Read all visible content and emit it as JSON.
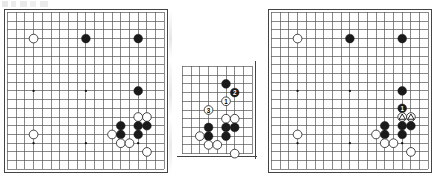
{
  "figure": {
    "background_color": "#ffffff",
    "line_color": "#555555",
    "border_color": "#444444",
    "black_stone_color": "#1a1a1a",
    "white_stone_color": "#ffffff",
    "white_stone_border": "#333333",
    "marker_label_black_color": "#ffffff",
    "marker_label_white_color": "#000000"
  },
  "boards": [
    {
      "id": "board-left",
      "name": "diagram-1",
      "kind": "full-board",
      "size": 19,
      "x": 7,
      "y": 12,
      "cell": 8.72,
      "star_points": [
        [
          4,
          4
        ],
        [
          10,
          4
        ],
        [
          16,
          4
        ],
        [
          4,
          10
        ],
        [
          10,
          10
        ],
        [
          16,
          10
        ],
        [
          4,
          16
        ],
        [
          10,
          16
        ],
        [
          16,
          16
        ]
      ],
      "stones": [
        {
          "col": 4,
          "row": 4,
          "color": "white"
        },
        {
          "col": 10,
          "row": 4,
          "color": "black"
        },
        {
          "col": 16,
          "row": 4,
          "color": "black"
        },
        {
          "col": 16,
          "row": 10,
          "color": "black"
        },
        {
          "col": 16,
          "row": 13,
          "color": "white"
        },
        {
          "col": 17,
          "row": 13,
          "color": "white"
        },
        {
          "col": 14,
          "row": 14,
          "color": "black"
        },
        {
          "col": 16,
          "row": 14,
          "color": "black"
        },
        {
          "col": 17,
          "row": 14,
          "color": "black"
        },
        {
          "col": 13,
          "row": 15,
          "color": "white"
        },
        {
          "col": 14,
          "row": 15,
          "color": "black"
        },
        {
          "col": 16,
          "row": 15,
          "color": "black"
        },
        {
          "col": 4,
          "row": 15,
          "color": "white"
        },
        {
          "col": 14,
          "row": 16,
          "color": "white"
        },
        {
          "col": 15,
          "row": 16,
          "color": "white"
        },
        {
          "col": 17,
          "row": 17,
          "color": "white"
        }
      ],
      "markers": []
    },
    {
      "id": "board-middle",
      "name": "diagram-2",
      "kind": "corner-section",
      "cols": 9,
      "rows": 11,
      "x": 182,
      "y": 66,
      "cell": 8.72,
      "edges": {
        "right": true,
        "bottom": true
      },
      "star_points": [],
      "stones": [
        {
          "col": 6,
          "row": 3,
          "color": "black"
        },
        {
          "col": 7,
          "row": 4,
          "color": "black"
        },
        {
          "col": 6,
          "row": 5,
          "color": "white"
        },
        {
          "col": 4,
          "row": 6,
          "color": "white"
        },
        {
          "col": 6,
          "row": 7,
          "color": "white"
        },
        {
          "col": 7,
          "row": 7,
          "color": "white"
        },
        {
          "col": 4,
          "row": 8,
          "color": "black"
        },
        {
          "col": 6,
          "row": 8,
          "color": "black"
        },
        {
          "col": 7,
          "row": 8,
          "color": "black"
        },
        {
          "col": 3,
          "row": 9,
          "color": "white"
        },
        {
          "col": 4,
          "row": 9,
          "color": "black"
        },
        {
          "col": 6,
          "row": 9,
          "color": "black"
        },
        {
          "col": 4,
          "row": 10,
          "color": "white"
        },
        {
          "col": 5,
          "row": 10,
          "color": "white"
        },
        {
          "col": 7,
          "row": 11,
          "color": "white"
        }
      ],
      "markers": [
        {
          "col": 6,
          "row": 5,
          "label": "1",
          "stone": "white"
        },
        {
          "col": 7,
          "row": 4,
          "label": "2",
          "stone": "black"
        },
        {
          "col": 4,
          "row": 6,
          "label": "3",
          "stone": "white"
        }
      ]
    },
    {
      "id": "board-right",
      "name": "diagram-3",
      "kind": "full-board",
      "size": 19,
      "x": 271,
      "y": 12,
      "cell": 8.72,
      "star_points": [
        [
          4,
          4
        ],
        [
          10,
          4
        ],
        [
          16,
          4
        ],
        [
          4,
          10
        ],
        [
          10,
          10
        ],
        [
          16,
          10
        ],
        [
          4,
          16
        ],
        [
          10,
          16
        ],
        [
          16,
          16
        ]
      ],
      "stones": [
        {
          "col": 4,
          "row": 4,
          "color": "white"
        },
        {
          "col": 10,
          "row": 4,
          "color": "black"
        },
        {
          "col": 16,
          "row": 4,
          "color": "black"
        },
        {
          "col": 16,
          "row": 10,
          "color": "black"
        },
        {
          "col": 16,
          "row": 12,
          "color": "black"
        },
        {
          "col": 16,
          "row": 13,
          "color": "white"
        },
        {
          "col": 17,
          "row": 13,
          "color": "white"
        },
        {
          "col": 14,
          "row": 14,
          "color": "black"
        },
        {
          "col": 16,
          "row": 14,
          "color": "black"
        },
        {
          "col": 17,
          "row": 14,
          "color": "black"
        },
        {
          "col": 13,
          "row": 15,
          "color": "white"
        },
        {
          "col": 14,
          "row": 15,
          "color": "black"
        },
        {
          "col": 16,
          "row": 15,
          "color": "black"
        },
        {
          "col": 4,
          "row": 15,
          "color": "white"
        },
        {
          "col": 14,
          "row": 16,
          "color": "white"
        },
        {
          "col": 15,
          "row": 16,
          "color": "white"
        },
        {
          "col": 17,
          "row": 17,
          "color": "white"
        }
      ],
      "markers": [
        {
          "col": 16,
          "row": 12,
          "label": "1",
          "stone": "black"
        },
        {
          "col": 16,
          "row": 13,
          "shape": "triangle",
          "stone": "white"
        },
        {
          "col": 17,
          "row": 13,
          "shape": "triangle",
          "stone": "white"
        }
      ]
    }
  ]
}
